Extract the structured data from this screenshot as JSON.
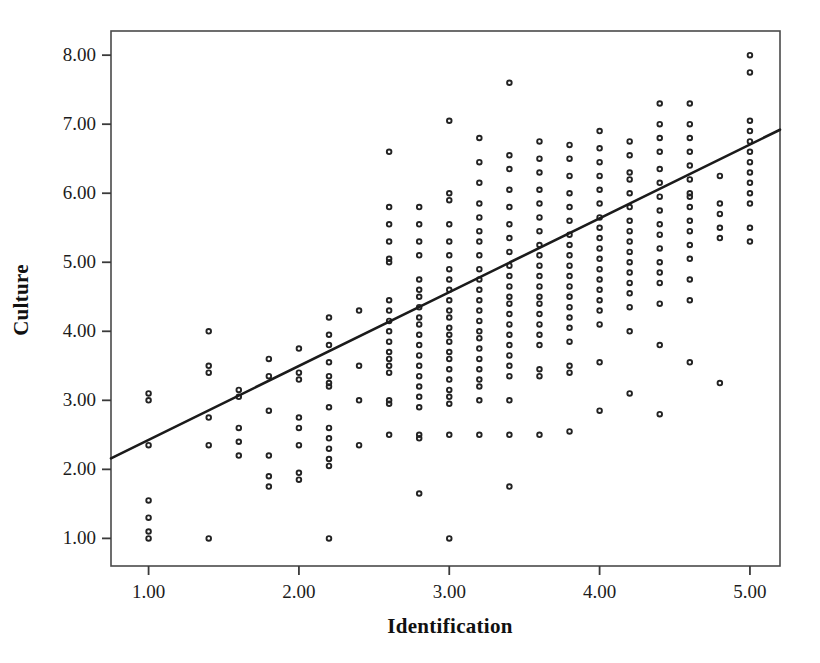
{
  "chart_data": {
    "type": "scatter",
    "title": "",
    "xlabel": "Identification",
    "ylabel": "Culture",
    "xlim": [
      0.75,
      5.2
    ],
    "ylim": [
      0.6,
      8.35
    ],
    "xticks": [
      "1.00",
      "2.00",
      "3.00",
      "4.00",
      "5.00"
    ],
    "xtick_values": [
      1,
      2,
      3,
      4,
      5
    ],
    "yticks": [
      "1.00",
      "2.00",
      "3.00",
      "4.00",
      "5.00",
      "6.00",
      "7.00",
      "8.00"
    ],
    "ytick_values": [
      1,
      2,
      3,
      4,
      5,
      6,
      7,
      8
    ],
    "grid": false,
    "legend": "none",
    "marker": "open-circle",
    "marker_color": "#232323",
    "fit_line": {
      "label": "linear-fit",
      "color": "#1b1b1b",
      "intercept": 1.36,
      "slope": 1.07,
      "x_start": 0.75,
      "x_end": 5.2,
      "y_start": 2.16,
      "y_end": 6.92
    },
    "points": [
      [
        1.0,
        1.0
      ],
      [
        1.0,
        1.1
      ],
      [
        1.0,
        1.3
      ],
      [
        1.0,
        1.55
      ],
      [
        1.0,
        2.35
      ],
      [
        1.0,
        3.0
      ],
      [
        1.0,
        3.1
      ],
      [
        1.4,
        1.0
      ],
      [
        1.4,
        2.35
      ],
      [
        1.4,
        2.75
      ],
      [
        1.4,
        3.4
      ],
      [
        1.4,
        3.5
      ],
      [
        1.4,
        4.0
      ],
      [
        1.6,
        2.2
      ],
      [
        1.6,
        2.4
      ],
      [
        1.6,
        2.6
      ],
      [
        1.6,
        3.05
      ],
      [
        1.6,
        3.15
      ],
      [
        1.8,
        1.75
      ],
      [
        1.8,
        1.9
      ],
      [
        1.8,
        2.2
      ],
      [
        1.8,
        2.85
      ],
      [
        1.8,
        3.35
      ],
      [
        1.8,
        3.6
      ],
      [
        2.0,
        1.85
      ],
      [
        2.0,
        1.95
      ],
      [
        2.0,
        2.35
      ],
      [
        2.0,
        2.6
      ],
      [
        2.0,
        2.75
      ],
      [
        2.0,
        3.3
      ],
      [
        2.0,
        3.4
      ],
      [
        2.0,
        3.75
      ],
      [
        2.2,
        1.0
      ],
      [
        2.2,
        2.05
      ],
      [
        2.2,
        2.15
      ],
      [
        2.2,
        2.3
      ],
      [
        2.2,
        2.45
      ],
      [
        2.2,
        2.6
      ],
      [
        2.2,
        2.9
      ],
      [
        2.2,
        3.2
      ],
      [
        2.2,
        3.25
      ],
      [
        2.2,
        3.35
      ],
      [
        2.2,
        3.55
      ],
      [
        2.2,
        3.8
      ],
      [
        2.2,
        3.95
      ],
      [
        2.2,
        4.2
      ],
      [
        2.4,
        2.35
      ],
      [
        2.4,
        3.0
      ],
      [
        2.4,
        3.5
      ],
      [
        2.4,
        4.3
      ],
      [
        2.6,
        2.5
      ],
      [
        2.6,
        2.95
      ],
      [
        2.6,
        3.0
      ],
      [
        2.6,
        3.4
      ],
      [
        2.6,
        3.5
      ],
      [
        2.6,
        3.6
      ],
      [
        2.6,
        3.7
      ],
      [
        2.6,
        3.85
      ],
      [
        2.6,
        4.0
      ],
      [
        2.6,
        4.15
      ],
      [
        2.6,
        4.3
      ],
      [
        2.6,
        4.45
      ],
      [
        2.6,
        5.0
      ],
      [
        2.6,
        5.05
      ],
      [
        2.6,
        5.3
      ],
      [
        2.6,
        5.55
      ],
      [
        2.6,
        5.8
      ],
      [
        2.6,
        6.6
      ],
      [
        2.8,
        1.65
      ],
      [
        2.8,
        2.45
      ],
      [
        2.8,
        2.5
      ],
      [
        2.8,
        2.9
      ],
      [
        2.8,
        3.05
      ],
      [
        2.8,
        3.2
      ],
      [
        2.8,
        3.35
      ],
      [
        2.8,
        3.5
      ],
      [
        2.8,
        3.65
      ],
      [
        2.8,
        3.8
      ],
      [
        2.8,
        3.95
      ],
      [
        2.8,
        4.1
      ],
      [
        2.8,
        4.2
      ],
      [
        2.8,
        4.35
      ],
      [
        2.8,
        4.5
      ],
      [
        2.8,
        4.6
      ],
      [
        2.8,
        4.75
      ],
      [
        2.8,
        5.1
      ],
      [
        2.8,
        5.3
      ],
      [
        2.8,
        5.55
      ],
      [
        2.8,
        5.8
      ],
      [
        3.0,
        1.0
      ],
      [
        3.0,
        2.5
      ],
      [
        3.0,
        2.95
      ],
      [
        3.0,
        3.05
      ],
      [
        3.0,
        3.15
      ],
      [
        3.0,
        3.3
      ],
      [
        3.0,
        3.45
      ],
      [
        3.0,
        3.6
      ],
      [
        3.0,
        3.7
      ],
      [
        3.0,
        3.85
      ],
      [
        3.0,
        3.95
      ],
      [
        3.0,
        4.05
      ],
      [
        3.0,
        4.2
      ],
      [
        3.0,
        4.3
      ],
      [
        3.0,
        4.45
      ],
      [
        3.0,
        4.6
      ],
      [
        3.0,
        4.75
      ],
      [
        3.0,
        4.9
      ],
      [
        3.0,
        5.1
      ],
      [
        3.0,
        5.3
      ],
      [
        3.0,
        5.55
      ],
      [
        3.0,
        5.9
      ],
      [
        3.0,
        6.0
      ],
      [
        3.0,
        7.05
      ],
      [
        3.2,
        2.5
      ],
      [
        3.2,
        3.0
      ],
      [
        3.2,
        3.2
      ],
      [
        3.2,
        3.3
      ],
      [
        3.2,
        3.45
      ],
      [
        3.2,
        3.6
      ],
      [
        3.2,
        3.75
      ],
      [
        3.2,
        3.9
      ],
      [
        3.2,
        4.0
      ],
      [
        3.2,
        4.15
      ],
      [
        3.2,
        4.3
      ],
      [
        3.2,
        4.45
      ],
      [
        3.2,
        4.6
      ],
      [
        3.2,
        4.75
      ],
      [
        3.2,
        4.9
      ],
      [
        3.2,
        5.1
      ],
      [
        3.2,
        5.3
      ],
      [
        3.2,
        5.45
      ],
      [
        3.2,
        5.65
      ],
      [
        3.2,
        5.85
      ],
      [
        3.2,
        6.15
      ],
      [
        3.2,
        6.45
      ],
      [
        3.2,
        6.8
      ],
      [
        3.4,
        1.75
      ],
      [
        3.4,
        2.5
      ],
      [
        3.4,
        3.0
      ],
      [
        3.4,
        3.35
      ],
      [
        3.4,
        3.5
      ],
      [
        3.4,
        3.65
      ],
      [
        3.4,
        3.8
      ],
      [
        3.4,
        3.95
      ],
      [
        3.4,
        4.1
      ],
      [
        3.4,
        4.25
      ],
      [
        3.4,
        4.4
      ],
      [
        3.4,
        4.5
      ],
      [
        3.4,
        4.65
      ],
      [
        3.4,
        4.8
      ],
      [
        3.4,
        4.95
      ],
      [
        3.4,
        5.15
      ],
      [
        3.4,
        5.35
      ],
      [
        3.4,
        5.55
      ],
      [
        3.4,
        5.8
      ],
      [
        3.4,
        6.05
      ],
      [
        3.4,
        6.35
      ],
      [
        3.4,
        6.55
      ],
      [
        3.4,
        7.6
      ],
      [
        3.6,
        2.5
      ],
      [
        3.6,
        3.35
      ],
      [
        3.6,
        3.45
      ],
      [
        3.6,
        3.8
      ],
      [
        3.6,
        3.95
      ],
      [
        3.6,
        4.1
      ],
      [
        3.6,
        4.25
      ],
      [
        3.6,
        4.4
      ],
      [
        3.6,
        4.5
      ],
      [
        3.6,
        4.65
      ],
      [
        3.6,
        4.8
      ],
      [
        3.6,
        4.95
      ],
      [
        3.6,
        5.1
      ],
      [
        3.6,
        5.25
      ],
      [
        3.6,
        5.45
      ],
      [
        3.6,
        5.65
      ],
      [
        3.6,
        5.85
      ],
      [
        3.6,
        6.05
      ],
      [
        3.6,
        6.3
      ],
      [
        3.6,
        6.5
      ],
      [
        3.6,
        6.75
      ],
      [
        3.8,
        2.55
      ],
      [
        3.8,
        3.4
      ],
      [
        3.8,
        3.5
      ],
      [
        3.8,
        3.85
      ],
      [
        3.8,
        4.05
      ],
      [
        3.8,
        4.2
      ],
      [
        3.8,
        4.35
      ],
      [
        3.8,
        4.5
      ],
      [
        3.8,
        4.65
      ],
      [
        3.8,
        4.8
      ],
      [
        3.8,
        4.95
      ],
      [
        3.8,
        5.1
      ],
      [
        3.8,
        5.25
      ],
      [
        3.8,
        5.4
      ],
      [
        3.8,
        5.6
      ],
      [
        3.8,
        5.8
      ],
      [
        3.8,
        6.0
      ],
      [
        3.8,
        6.25
      ],
      [
        3.8,
        6.5
      ],
      [
        3.8,
        6.7
      ],
      [
        4.0,
        2.85
      ],
      [
        4.0,
        3.55
      ],
      [
        4.0,
        4.1
      ],
      [
        4.0,
        4.3
      ],
      [
        4.0,
        4.45
      ],
      [
        4.0,
        4.6
      ],
      [
        4.0,
        4.75
      ],
      [
        4.0,
        4.9
      ],
      [
        4.0,
        5.05
      ],
      [
        4.0,
        5.2
      ],
      [
        4.0,
        5.35
      ],
      [
        4.0,
        5.5
      ],
      [
        4.0,
        5.65
      ],
      [
        4.0,
        5.85
      ],
      [
        4.0,
        6.05
      ],
      [
        4.0,
        6.25
      ],
      [
        4.0,
        6.45
      ],
      [
        4.0,
        6.65
      ],
      [
        4.0,
        6.9
      ],
      [
        4.2,
        3.1
      ],
      [
        4.2,
        4.0
      ],
      [
        4.2,
        4.35
      ],
      [
        4.2,
        4.55
      ],
      [
        4.2,
        4.7
      ],
      [
        4.2,
        4.85
      ],
      [
        4.2,
        5.0
      ],
      [
        4.2,
        5.15
      ],
      [
        4.2,
        5.3
      ],
      [
        4.2,
        5.45
      ],
      [
        4.2,
        5.6
      ],
      [
        4.2,
        5.8
      ],
      [
        4.2,
        6.0
      ],
      [
        4.2,
        6.2
      ],
      [
        4.2,
        6.3
      ],
      [
        4.2,
        6.55
      ],
      [
        4.2,
        6.75
      ],
      [
        4.4,
        2.8
      ],
      [
        4.4,
        3.8
      ],
      [
        4.4,
        4.4
      ],
      [
        4.4,
        4.7
      ],
      [
        4.4,
        4.85
      ],
      [
        4.4,
        5.0
      ],
      [
        4.4,
        5.2
      ],
      [
        4.4,
        5.4
      ],
      [
        4.4,
        5.55
      ],
      [
        4.4,
        5.75
      ],
      [
        4.4,
        5.95
      ],
      [
        4.4,
        6.15
      ],
      [
        4.4,
        6.35
      ],
      [
        4.4,
        6.6
      ],
      [
        4.4,
        6.8
      ],
      [
        4.4,
        7.0
      ],
      [
        4.4,
        7.3
      ],
      [
        4.6,
        3.55
      ],
      [
        4.6,
        4.45
      ],
      [
        4.6,
        4.75
      ],
      [
        4.6,
        5.05
      ],
      [
        4.6,
        5.25
      ],
      [
        4.6,
        5.45
      ],
      [
        4.6,
        5.6
      ],
      [
        4.6,
        5.8
      ],
      [
        4.6,
        5.95
      ],
      [
        4.6,
        6.0
      ],
      [
        4.6,
        6.2
      ],
      [
        4.6,
        6.4
      ],
      [
        4.6,
        6.6
      ],
      [
        4.6,
        6.8
      ],
      [
        4.6,
        7.0
      ],
      [
        4.6,
        7.3
      ],
      [
        4.8,
        3.25
      ],
      [
        4.8,
        5.35
      ],
      [
        4.8,
        5.5
      ],
      [
        4.8,
        5.7
      ],
      [
        4.8,
        5.85
      ],
      [
        4.8,
        6.25
      ],
      [
        5.0,
        5.3
      ],
      [
        5.0,
        5.5
      ],
      [
        5.0,
        5.85
      ],
      [
        5.0,
        6.0
      ],
      [
        5.0,
        6.15
      ],
      [
        5.0,
        6.3
      ],
      [
        5.0,
        6.45
      ],
      [
        5.0,
        6.6
      ],
      [
        5.0,
        6.75
      ],
      [
        5.0,
        6.9
      ],
      [
        5.0,
        7.05
      ],
      [
        5.0,
        7.75
      ],
      [
        5.0,
        8.0
      ]
    ]
  },
  "axes": {
    "x_title": "Identification",
    "y_title": "Culture"
  }
}
